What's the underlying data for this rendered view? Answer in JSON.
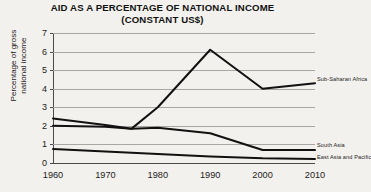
{
  "chart_data": {
    "type": "line",
    "title": "AID AS A PERCENTAGE OF NATIONAL INCOME",
    "subtitle": "(CONSTANT US$)",
    "xlabel": "",
    "ylabel": "Percentage of gross\nnational income",
    "xlim": [
      1960,
      2010
    ],
    "ylim": [
      0,
      7
    ],
    "xticks": [
      "1960",
      "1970",
      "1980",
      "1990",
      "2000",
      "2010"
    ],
    "yticks": [
      "0",
      "1",
      "2",
      "3",
      "4",
      "5",
      "6",
      "7"
    ],
    "grid": true,
    "legend_position": "right-inline",
    "x": [
      1960,
      1970,
      1975,
      1980,
      1990,
      2000,
      2010
    ],
    "series": [
      {
        "name": "Sub-Saharan Africa",
        "color": "#111111",
        "values": [
          2.0,
          1.95,
          1.85,
          3.0,
          6.1,
          4.0,
          4.3
        ],
        "label_value": 4.55
      },
      {
        "name": "South Asia",
        "color": "#111111",
        "values": [
          2.4,
          2.05,
          1.85,
          1.9,
          1.6,
          0.7,
          0.7
        ],
        "label_value": 0.95
      },
      {
        "name": "East Asia and Pacific",
        "color": "#111111",
        "values": [
          0.75,
          0.62,
          0.55,
          0.48,
          0.35,
          0.25,
          0.22
        ],
        "label_value": 0.35
      }
    ]
  }
}
